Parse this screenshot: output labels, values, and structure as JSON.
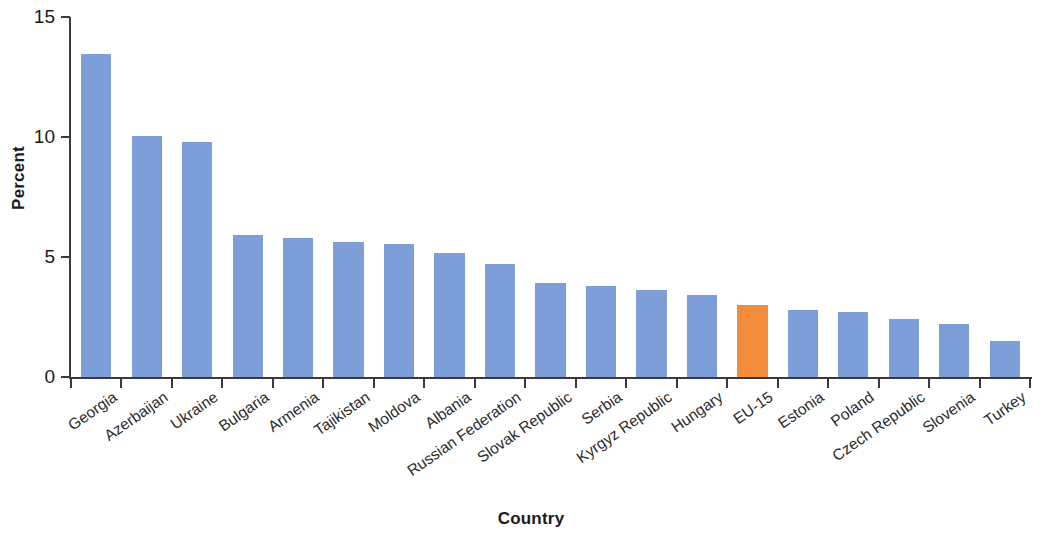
{
  "chart_data": {
    "type": "bar",
    "title": "",
    "xlabel": "Country",
    "ylabel": "Percent",
    "ylim": [
      0,
      15
    ],
    "yticks": [
      0,
      5,
      10,
      15
    ],
    "ytick_labels": [
      "0",
      "5",
      "10",
      "15"
    ],
    "grid": false,
    "legend": null,
    "categories": [
      "Georgia",
      "Azerbaijan",
      "Ukraine",
      "Bulgaria",
      "Armenia",
      "Tajikistan",
      "Moldova",
      "Albania",
      "Russian Federation",
      "Slovak Republic",
      "Serbia",
      "Kyrgyz Republic",
      "Hungary",
      "EU-15",
      "Estonia",
      "Poland",
      "Czech Republic",
      "Slovenia",
      "Turkey"
    ],
    "values": [
      13.5,
      10.1,
      9.85,
      5.95,
      5.85,
      5.65,
      5.6,
      5.2,
      4.75,
      3.95,
      3.85,
      3.65,
      3.45,
      3.05,
      2.85,
      2.75,
      2.45,
      2.25,
      1.55
    ],
    "bar_colors": [
      "#7d9ed9",
      "#7d9ed9",
      "#7d9ed9",
      "#7d9ed9",
      "#7d9ed9",
      "#7d9ed9",
      "#7d9ed9",
      "#7d9ed9",
      "#7d9ed9",
      "#7d9ed9",
      "#7d9ed9",
      "#7d9ed9",
      "#7d9ed9",
      "#f08c3c",
      "#7d9ed9",
      "#7d9ed9",
      "#7d9ed9",
      "#7d9ed9",
      "#7d9ed9"
    ],
    "highlight_category": "EU-15",
    "colors": {
      "bar_default": "#7d9ed9",
      "bar_highlight": "#f08c3c",
      "axis": "#3a3a3a",
      "text": "#1a1a1a",
      "background": "#ffffff"
    }
  }
}
